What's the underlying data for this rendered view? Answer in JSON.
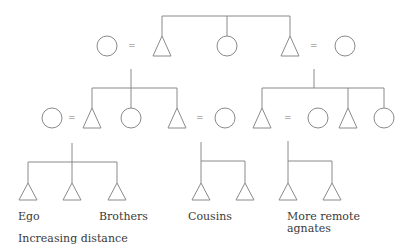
{
  "diagram": {
    "type": "kinship-chart",
    "stroke_color": "#8a8a8a",
    "labels": {
      "ego": "Ego",
      "brothers": "Brothers",
      "cousins": "Cousins",
      "remote": "More remote\nagnates",
      "caption": "Increasing distance"
    },
    "marriage_symbol": "=",
    "generations": [
      {
        "level": 1,
        "members": [
          "female",
          "male",
          "female",
          "male",
          "female"
        ],
        "description": "Grandparental generation: wife = male sibling, sister, male sibling = wife"
      },
      {
        "level": 2,
        "members": [
          "female",
          "male",
          "female",
          "male",
          "female",
          "male",
          "female",
          "male",
          "female"
        ],
        "description": "Parental generation"
      },
      {
        "level": 3,
        "members": [
          "male",
          "male",
          "male",
          "male",
          "male",
          "male",
          "male"
        ],
        "groups": [
          "Ego",
          "Brothers",
          "Cousins",
          "More remote agnates"
        ]
      }
    ]
  }
}
